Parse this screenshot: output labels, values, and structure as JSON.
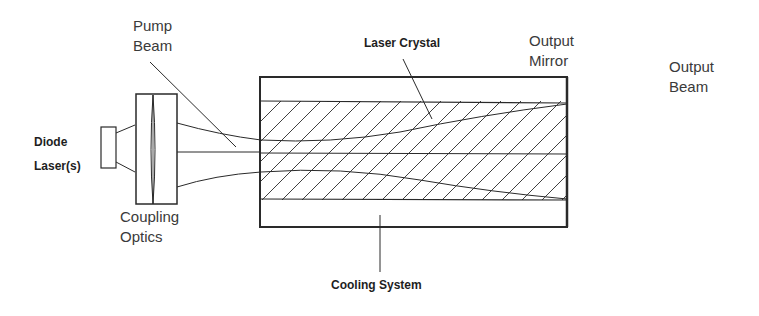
{
  "diagram": {
    "type": "schematic",
    "labels": {
      "pump_beam": [
        "Pump",
        "Beam"
      ],
      "diode_lasers": [
        "Diode",
        "Laser(s)"
      ],
      "coupling_optics": [
        "Coupling",
        "Optics"
      ],
      "laser_crystal": "Laser Crystal",
      "output_mirror": [
        "Output",
        "Mirror"
      ],
      "output_beam": [
        "Output",
        "Beam"
      ],
      "cooling_system": "Cooling System"
    },
    "colors": {
      "line": "#2a2a2a",
      "text": "#3a3a3a",
      "background": "#ffffff"
    }
  }
}
